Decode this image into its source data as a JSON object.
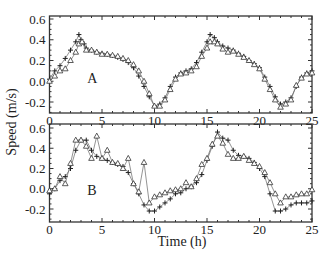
{
  "chart_data": [
    {
      "type": "line",
      "panel_label": "A",
      "xlabel": "Time (h)",
      "ylabel": "Speed (m/s)",
      "xlim": [
        0,
        25
      ],
      "ylim": [
        -0.3,
        0.6
      ],
      "xticks": [
        0,
        5,
        10,
        15,
        20,
        25
      ],
      "yticks": [
        -0.2,
        0.0,
        0.2,
        0.4,
        0.6
      ],
      "ytick_labels": [
        "-0.2",
        "0.0",
        "0.2",
        "0.4",
        "0.6"
      ],
      "grid": false,
      "series": [
        {
          "name": "plus",
          "marker": "+",
          "x": [
            0,
            0.5,
            1,
            1.5,
            2,
            2.5,
            2.8,
            3,
            3.3,
            3.5,
            4,
            4.5,
            5,
            5.5,
            6,
            6.5,
            7,
            7.5,
            8,
            8.5,
            9,
            9.5,
            10,
            10.5,
            11,
            11.5,
            12,
            12.5,
            13,
            13.5,
            14,
            14.5,
            15,
            15.3,
            15.7,
            16,
            16.5,
            17,
            17.5,
            18,
            18.5,
            19,
            19.5,
            20,
            20.5,
            21,
            21.5,
            22,
            22.5,
            23,
            23.5,
            24,
            24.5,
            25
          ],
          "y": [
            0.02,
            0.1,
            0.15,
            0.22,
            0.3,
            0.38,
            0.45,
            0.4,
            0.36,
            0.32,
            0.3,
            0.28,
            0.27,
            0.26,
            0.25,
            0.23,
            0.21,
            0.18,
            0.13,
            0.05,
            -0.05,
            -0.15,
            -0.24,
            -0.22,
            -0.16,
            -0.05,
            0.04,
            0.08,
            0.1,
            0.12,
            0.18,
            0.28,
            0.38,
            0.45,
            0.42,
            0.38,
            0.34,
            0.32,
            0.3,
            0.27,
            0.24,
            0.2,
            0.17,
            0.13,
            0.04,
            -0.05,
            -0.15,
            -0.22,
            -0.2,
            -0.16,
            -0.05,
            0.04,
            0.08,
            0.1
          ]
        },
        {
          "name": "triangle",
          "marker": "triangle",
          "x": [
            0,
            0.5,
            1,
            1.5,
            2,
            2.5,
            2.8,
            3.1,
            3.5,
            4,
            4.5,
            5,
            5.5,
            6,
            6.5,
            7,
            7.5,
            8,
            8.5,
            9,
            9.5,
            10,
            10.5,
            11,
            11.5,
            12,
            12.5,
            13,
            13.5,
            14,
            14.5,
            15,
            15.3,
            15.7,
            16,
            16.5,
            17,
            17.5,
            18,
            18.5,
            19,
            19.5,
            20,
            20.5,
            21,
            21.5,
            22,
            22.5,
            23,
            23.5,
            24,
            24.5,
            25
          ],
          "y": [
            0.0,
            0.05,
            0.1,
            0.12,
            0.2,
            0.28,
            0.36,
            0.38,
            0.3,
            0.3,
            0.28,
            0.26,
            0.26,
            0.25,
            0.24,
            0.22,
            0.2,
            0.16,
            0.1,
            0.0,
            -0.12,
            -0.24,
            -0.24,
            -0.18,
            -0.08,
            0.02,
            0.07,
            0.08,
            0.1,
            0.14,
            0.24,
            0.32,
            0.38,
            0.38,
            0.36,
            0.31,
            0.28,
            0.29,
            0.26,
            0.23,
            0.2,
            0.16,
            0.12,
            0.02,
            -0.08,
            -0.18,
            -0.25,
            -0.22,
            -0.18,
            -0.04,
            0.03,
            0.07,
            0.08
          ]
        }
      ]
    },
    {
      "type": "line",
      "panel_label": "B",
      "xlabel": "Time (h)",
      "ylabel": "Speed (m/s)",
      "xlim": [
        0,
        25
      ],
      "ylim": [
        -0.32,
        0.6
      ],
      "xticks": [
        0,
        5,
        10,
        15,
        20,
        25
      ],
      "yticks": [
        -0.2,
        0.0,
        0.2,
        0.4,
        0.6
      ],
      "ytick_labels": [
        "-0.2",
        "0.0",
        "0.2",
        "0.4",
        "0.6"
      ],
      "grid": false,
      "series": [
        {
          "name": "plus",
          "marker": "+",
          "x": [
            0,
            0.5,
            1,
            1.5,
            2,
            2.5,
            3,
            3.5,
            4,
            4.5,
            5,
            5.5,
            6,
            6.5,
            7,
            7.5,
            8,
            8.5,
            9,
            9.5,
            10,
            10.5,
            11,
            11.5,
            12,
            12.5,
            13,
            13.5,
            14,
            14.5,
            15,
            15.5,
            16,
            16.5,
            17,
            17.5,
            18,
            18.5,
            19,
            19.5,
            20,
            20.5,
            21,
            21.5,
            22,
            22.5,
            23,
            23.5,
            24,
            24.5,
            25
          ],
          "y": [
            -0.05,
            0.0,
            0.08,
            0.12,
            0.2,
            0.38,
            0.48,
            0.48,
            0.38,
            0.32,
            0.3,
            0.28,
            0.26,
            0.24,
            0.22,
            0.16,
            0.05,
            -0.05,
            -0.16,
            -0.22,
            -0.22,
            -0.18,
            -0.14,
            -0.1,
            -0.05,
            -0.04,
            0.0,
            0.02,
            0.06,
            0.14,
            0.28,
            0.42,
            0.56,
            0.5,
            0.48,
            0.38,
            0.33,
            0.32,
            0.3,
            0.26,
            0.2,
            0.12,
            -0.05,
            -0.22,
            -0.22,
            -0.2,
            -0.16,
            -0.14,
            -0.14,
            -0.14,
            -0.12
          ]
        },
        {
          "name": "triangle",
          "marker": "triangle",
          "x": [
            0,
            0.5,
            1,
            1.5,
            2,
            2.5,
            3,
            3.5,
            4,
            4.5,
            5,
            5.5,
            6,
            6.5,
            7,
            7.5,
            8,
            8.5,
            9,
            9.5,
            10,
            10.5,
            11,
            11.5,
            12,
            12.5,
            13,
            13.5,
            14,
            14.5,
            15,
            15.5,
            16,
            16.5,
            17,
            17.5,
            18,
            18.5,
            19,
            19.5,
            20,
            20.5,
            21,
            21.5,
            22,
            22.5,
            23,
            23.5,
            24,
            24.5,
            25
          ],
          "y": [
            -0.02,
            0.0,
            0.12,
            0.05,
            0.25,
            0.48,
            0.48,
            0.42,
            0.3,
            0.52,
            0.3,
            0.38,
            0.26,
            0.25,
            0.2,
            0.3,
            0.05,
            -0.03,
            0.26,
            -0.14,
            -0.08,
            -0.06,
            -0.04,
            -0.02,
            -0.01,
            0.0,
            0.06,
            0.02,
            0.1,
            0.24,
            0.3,
            0.44,
            0.52,
            0.45,
            0.34,
            0.3,
            0.3,
            0.32,
            0.28,
            0.25,
            0.22,
            0.16,
            0.06,
            -0.05,
            -0.14,
            -0.08,
            -0.08,
            -0.06,
            -0.05,
            -0.05,
            -0.01
          ]
        }
      ]
    }
  ],
  "figure": {
    "xlabel": "Time (h)",
    "ylabel": "Speed (m/s)",
    "panels": [
      {
        "label": "A"
      },
      {
        "label": "B"
      }
    ],
    "xtick_labels": [
      "0",
      "5",
      "10",
      "15",
      "20",
      "25"
    ],
    "ytick_labels": [
      "-0.2",
      "0.0",
      "0.2",
      "0.4",
      "0.6"
    ]
  }
}
